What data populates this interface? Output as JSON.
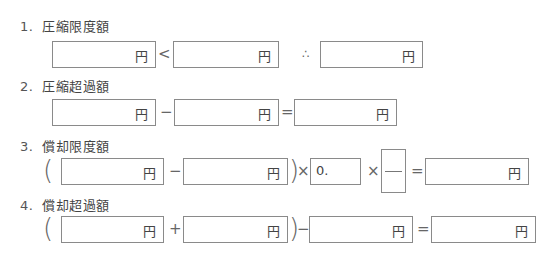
{
  "sections": [
    {
      "number": "1.",
      "title": "圧縮限度額"
    },
    {
      "number": "2.",
      "title": "圧縮超過額"
    },
    {
      "number": "3.",
      "title": "償却限度額"
    },
    {
      "number": "4.",
      "title": "償却超過額"
    }
  ],
  "unit": "円",
  "operators": {
    "less_than": "<",
    "therefore": "∴",
    "minus": "−",
    "plus": "+",
    "equals": "=",
    "times": "×",
    "open_paren": "(",
    "close_paren": ")"
  },
  "rate_prefix": "0.",
  "fields": {
    "r1_a": "",
    "r1_b": "",
    "r1_result": "",
    "r2_a": "",
    "r2_b": "",
    "r2_result": "",
    "r3_a": "",
    "r3_b": "",
    "r3_rate": "",
    "r3_fraction_num": "",
    "r3_fraction_den": "",
    "r3_result": "",
    "r4_a": "",
    "r4_b": "",
    "r4_c": "",
    "r4_result": ""
  }
}
